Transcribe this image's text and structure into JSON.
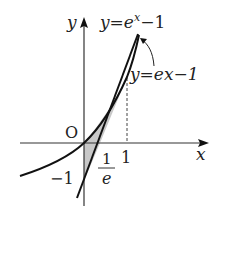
{
  "diagram": {
    "axes": {
      "x_label": "x",
      "y_label": "y",
      "origin_label": "O"
    },
    "curves": [
      {
        "name": "exponential",
        "label_prefix": "y=e",
        "label_sup": "x",
        "label_suffix": "−1"
      },
      {
        "name": "tangent",
        "label": "y=ex−1"
      }
    ],
    "ticks": {
      "x_one": "1",
      "y_minus_one": "−1",
      "x_intercept_num": "1",
      "x_intercept_den": "e"
    },
    "colors": {
      "stroke": "#111111",
      "axis": "#333333",
      "shade": "#c8c8c8"
    }
  }
}
